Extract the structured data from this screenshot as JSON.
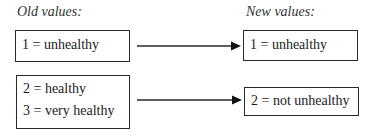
{
  "diagram": {
    "old_header": "Old values:",
    "new_header": "New values:",
    "old_groups": [
      {
        "lines": [
          "1 = unhealthy"
        ]
      },
      {
        "lines": [
          "2 = healthy",
          "3 = very healthy"
        ]
      }
    ],
    "new_groups": [
      {
        "lines": [
          "1 = unhealthy"
        ]
      },
      {
        "lines": [
          "2 = not unhealthy"
        ]
      }
    ],
    "mappings": [
      {
        "from": "old_groups.0",
        "to": "new_groups.0"
      },
      {
        "from": "old_groups.1",
        "to": "new_groups.1"
      }
    ],
    "colors": {
      "stroke": "#2a2a2a",
      "text": "#1a1a1a",
      "background": "#ffffff"
    }
  }
}
